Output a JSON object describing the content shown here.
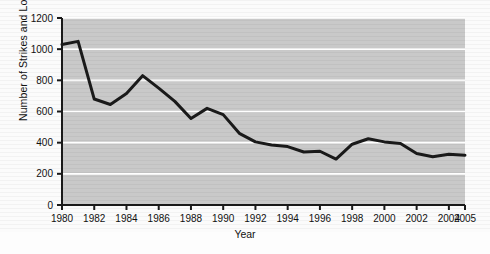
{
  "chart_data": {
    "type": "line",
    "title": "",
    "xlabel": "Year",
    "ylabel": "Number of Strikes and Lockouts",
    "xlim": [
      1980,
      2005
    ],
    "ylim": [
      0,
      1200
    ],
    "grid": true,
    "legend": "none",
    "xticklabels": [
      "1980",
      "1982",
      "1984",
      "1986",
      "1988",
      "1990",
      "1992",
      "1994",
      "1996",
      "1998",
      "2000",
      "2002",
      "2004",
      "2005"
    ],
    "xtickvalues": [
      1980,
      1982,
      1984,
      1986,
      1988,
      1990,
      1992,
      1994,
      1996,
      1998,
      2000,
      2002,
      2004,
      2005
    ],
    "yticklabels": [
      "0",
      "200",
      "400",
      "600",
      "800",
      "1000",
      "1200"
    ],
    "ytickvalues": [
      0,
      200,
      400,
      600,
      800,
      1000,
      1200
    ],
    "x": [
      1980,
      1981,
      1982,
      1983,
      1984,
      1985,
      1986,
      1987,
      1988,
      1989,
      1990,
      1991,
      1992,
      1993,
      1994,
      1995,
      1996,
      1997,
      1998,
      1999,
      2000,
      2001,
      2002,
      2003,
      2004,
      2005
    ],
    "values": [
      1030,
      1050,
      680,
      645,
      715,
      830,
      750,
      665,
      555,
      620,
      580,
      460,
      405,
      385,
      375,
      340,
      345,
      295,
      390,
      425,
      405,
      395,
      330,
      310,
      325,
      320
    ],
    "series": [
      {
        "name": "Number of Strikes and Lockouts",
        "color": "#1a1a1a",
        "values": [
          1030,
          1050,
          680,
          645,
          715,
          830,
          750,
          665,
          555,
          620,
          580,
          460,
          405,
          385,
          375,
          340,
          345,
          295,
          390,
          425,
          405,
          395,
          330,
          310,
          325,
          320
        ]
      }
    ]
  },
  "style": {
    "plot_background": "#c9c9c9",
    "page_background": "#fbfbfb",
    "gridline_color": "#ffffff",
    "axis_color": "#1a1a1a",
    "line_color": "#1a1a1a"
  }
}
